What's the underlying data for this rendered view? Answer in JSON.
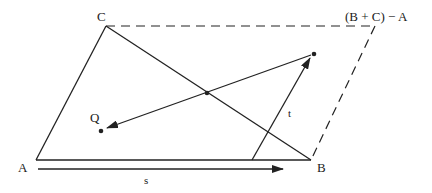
{
  "diagram": {
    "type": "geometric-parallelogram",
    "colors": {
      "stroke": "#222222",
      "background": "#ffffff"
    },
    "points": {
      "A": {
        "label": "A",
        "x": 36,
        "y": 160
      },
      "B": {
        "label": "B",
        "x": 311,
        "y": 160
      },
      "C": {
        "label": "C",
        "x": 106,
        "y": 26
      },
      "D": {
        "label": "(B + C) − A",
        "x": 375,
        "y": 26
      },
      "Q": {
        "label": "Q",
        "x": 101,
        "y": 131
      },
      "P": {
        "label": "",
        "x": 314,
        "y": 54
      },
      "M": {
        "label": "",
        "x": 207,
        "y": 93
      }
    },
    "vectors": {
      "s": {
        "label": "s",
        "from": [
          38,
          169
        ],
        "to": [
          283,
          169
        ]
      },
      "t": {
        "label": "t",
        "from": [
          252,
          160
        ],
        "to": [
          310,
          58
        ]
      },
      "PQ": {
        "label": "",
        "from": [
          314,
          54
        ],
        "to": [
          107,
          128
        ]
      }
    },
    "edges": {
      "solid": [
        "A-B",
        "A-C",
        "C-B"
      ],
      "dashed": [
        "C-D",
        "D-B"
      ]
    }
  }
}
